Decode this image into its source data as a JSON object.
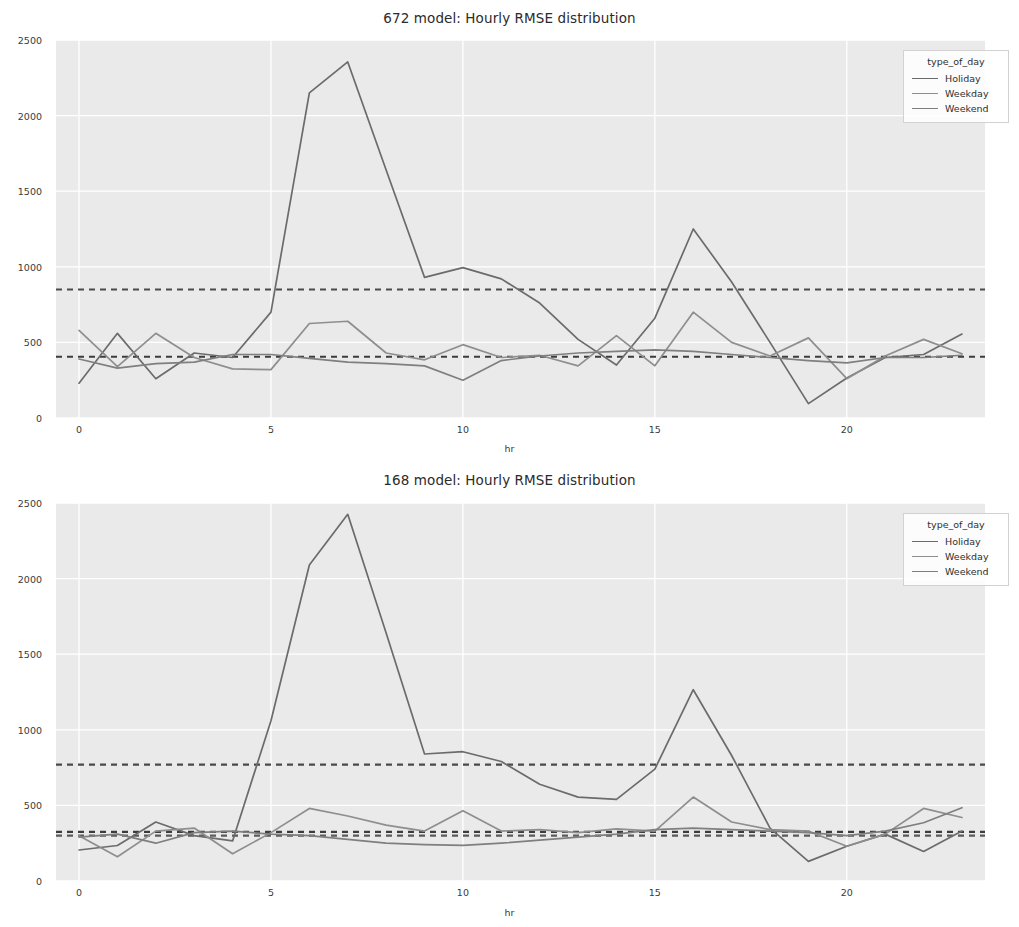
{
  "page": {
    "background": "#ffffff",
    "top_fragment": ""
  },
  "style": {
    "plot_bg": "#eaeaea",
    "grid_color": "#ffffff",
    "text_color": "#3a3a3a",
    "holiday_color": "#6b6b6b",
    "weekday_color": "#8e8e8e",
    "weekend_color": "#7f7f7f",
    "dashed_color": "#4a4a4a"
  },
  "legend": {
    "title": "type_of_day",
    "entries": [
      {
        "label": "Holiday",
        "color": "#6b6b6b"
      },
      {
        "label": "Weekday",
        "color": "#8e8e8e"
      },
      {
        "label": "Weekend",
        "color": "#7f7f7f"
      }
    ]
  },
  "chart_data": [
    {
      "id": "chart-672",
      "type": "line",
      "title": "672 model: Hourly RMSE distribution",
      "xlabel": "hr",
      "ylabel": "",
      "xlim": [
        -0.6,
        23.6
      ],
      "ylim": [
        0,
        2500
      ],
      "xticks": [
        0,
        5,
        10,
        15,
        20
      ],
      "yticks": [
        0,
        500,
        1000,
        1500,
        2000,
        2500
      ],
      "grid": true,
      "legend_position": "upper right",
      "x": [
        0,
        1,
        2,
        3,
        4,
        5,
        6,
        7,
        8,
        9,
        10,
        11,
        12,
        13,
        14,
        15,
        16,
        17,
        18,
        19,
        20,
        21,
        22,
        23
      ],
      "series": [
        {
          "name": "Holiday",
          "color": "#6b6b6b",
          "values": [
            230,
            560,
            260,
            430,
            400,
            700,
            2150,
            2355,
            1640,
            930,
            995,
            920,
            760,
            520,
            350,
            660,
            1250,
            900,
            500,
            95,
            265,
            400,
            420,
            555
          ]
        },
        {
          "name": "Weekday",
          "color": "#8e8e8e",
          "values": [
            580,
            340,
            560,
            400,
            325,
            320,
            625,
            640,
            430,
            385,
            485,
            400,
            415,
            345,
            545,
            345,
            700,
            500,
            410,
            530,
            260,
            410,
            520,
            425
          ]
        },
        {
          "name": "Weekend",
          "color": "#7f7f7f",
          "values": [
            390,
            330,
            360,
            370,
            420,
            420,
            395,
            370,
            360,
            345,
            250,
            380,
            410,
            430,
            440,
            450,
            440,
            420,
            400,
            380,
            365,
            400,
            400,
            415
          ]
        }
      ],
      "hlines": [
        {
          "name": "holiday-mean",
          "value": 850,
          "style": "dashed",
          "color": "#4a4a4a"
        },
        {
          "name": "overall-mean",
          "value": 405,
          "style": "dashed",
          "color": "#3c3c3c"
        }
      ]
    },
    {
      "id": "chart-168",
      "type": "line",
      "title": "168 model: Hourly RMSE distribution",
      "xlabel": "hr",
      "ylabel": "",
      "xlim": [
        -0.6,
        23.6
      ],
      "ylim": [
        0,
        2500
      ],
      "xticks": [
        0,
        5,
        10,
        15,
        20
      ],
      "yticks": [
        0,
        500,
        1000,
        1500,
        2000,
        2500
      ],
      "grid": true,
      "legend_position": "upper right",
      "x": [
        0,
        1,
        2,
        3,
        4,
        5,
        6,
        7,
        8,
        9,
        10,
        11,
        12,
        13,
        14,
        15,
        16,
        17,
        18,
        19,
        20,
        21,
        22,
        23
      ],
      "series": [
        {
          "name": "Holiday",
          "color": "#6b6b6b",
          "values": [
            205,
            235,
            390,
            300,
            265,
            1060,
            2090,
            2425,
            1640,
            840,
            855,
            790,
            640,
            555,
            540,
            740,
            1265,
            830,
            350,
            130,
            230,
            310,
            195,
            330
          ]
        },
        {
          "name": "Weekday",
          "color": "#8e8e8e",
          "values": [
            300,
            160,
            330,
            350,
            180,
            320,
            480,
            430,
            370,
            330,
            465,
            330,
            340,
            320,
            345,
            330,
            555,
            390,
            340,
            330,
            230,
            310,
            480,
            420
          ]
        },
        {
          "name": "Weekend",
          "color": "#7f7f7f",
          "values": [
            290,
            310,
            250,
            320,
            330,
            310,
            300,
            275,
            250,
            240,
            235,
            250,
            270,
            290,
            310,
            340,
            350,
            340,
            330,
            320,
            300,
            330,
            385,
            485
          ]
        }
      ],
      "hlines": [
        {
          "name": "holiday-mean",
          "value": 770,
          "style": "dashed",
          "color": "#4a4a4a"
        },
        {
          "name": "overall-mean-upper",
          "value": 325,
          "style": "dashed",
          "color": "#3c3c3c"
        },
        {
          "name": "overall-mean-lower",
          "value": 300,
          "style": "dashed",
          "color": "#5a5a5a"
        }
      ]
    }
  ]
}
